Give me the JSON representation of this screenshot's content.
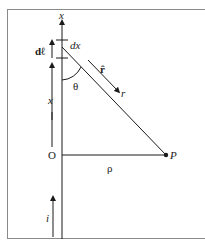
{
  "diagram": {
    "type": "biot-savart-straight-wire",
    "labels": {
      "axis": "x",
      "segment": "dx",
      "dl": "dℓ",
      "unit_vector": "r̂",
      "r": "r",
      "theta": "θ",
      "x_distance": "x",
      "origin": "O",
      "rho": "ρ",
      "point": "P",
      "current": "i"
    },
    "colors": {
      "line": "#1a1a1a",
      "frame": "#8a8a8a",
      "background": "#ffffff"
    }
  }
}
